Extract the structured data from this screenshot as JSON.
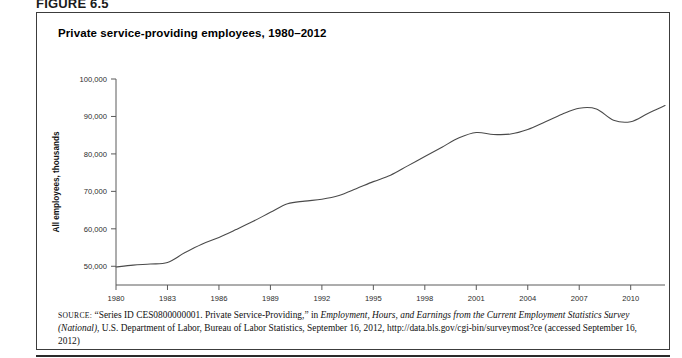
{
  "figure": {
    "label": "FIGURE 6.5",
    "title": "Private service-providing employees, 1980–2012"
  },
  "source": {
    "prefix": "SOURCE:",
    "part1": " “Series ID CES0800000001. Private Service-Providing,” in ",
    "italic1": "Employment, Hours, and Earnings from the Current Employment Statistics Survey (National)",
    "part2": ", U.S. Department of Labor, Bureau of Labor Statistics, September 16, 2012, http://data.bls.gov/cgi-bin/surveymost?ce (accessed September 16, 2012)"
  },
  "chart_data": {
    "type": "line",
    "title": "Private service-providing employees, 1980–2012",
    "xlabel": "Year",
    "ylabel": "All employees, thousands",
    "xlim": [
      1980,
      2012
    ],
    "ylim": [
      45000,
      100000
    ],
    "y_axis_min_label": 50000,
    "grid": false,
    "legend": "none",
    "x_ticks": [
      1980,
      1983,
      1986,
      1989,
      1992,
      1995,
      1998,
      2001,
      2004,
      2007,
      2010
    ],
    "x_tick_labels": [
      "1980",
      "1983",
      "1986",
      "1989",
      "1992",
      "1995",
      "1998",
      "2001",
      "2004",
      "2007",
      "2010"
    ],
    "y_ticks": [
      50000,
      60000,
      70000,
      80000,
      90000,
      100000
    ],
    "y_tick_labels": [
      "50,000",
      "60,000",
      "70,000",
      "80,000",
      "90,000",
      "100,000"
    ],
    "series": [
      {
        "name": "Private service-providing employees",
        "color": "#4a4a4a",
        "x": [
          1980,
          1981,
          1982,
          1983,
          1984,
          1985,
          1986,
          1987,
          1988,
          1989,
          1990,
          1991,
          1992,
          1993,
          1994,
          1995,
          1996,
          1997,
          1998,
          1999,
          2000,
          2001,
          2002,
          2003,
          2004,
          2005,
          2006,
          2007,
          2008,
          2009,
          2010,
          2011,
          2012
        ],
        "values": [
          49800,
          50300,
          50600,
          51000,
          53600,
          55900,
          57700,
          59800,
          62000,
          64400,
          66700,
          67400,
          67900,
          68900,
          70700,
          72600,
          74300,
          76800,
          79300,
          81800,
          84300,
          85700,
          85200,
          85300,
          86500,
          88500,
          90600,
          92200,
          92000,
          89000,
          88600,
          90800,
          92900
        ]
      }
    ]
  }
}
